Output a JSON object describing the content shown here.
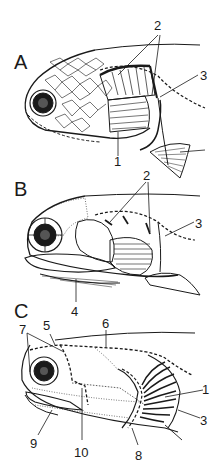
{
  "figure": {
    "panels": [
      {
        "id": "A",
        "label": "A",
        "callouts": [
          "1",
          "2",
          "3"
        ]
      },
      {
        "id": "B",
        "label": "B",
        "callouts": [
          "2",
          "3",
          "4"
        ]
      },
      {
        "id": "C",
        "label": "C",
        "callouts": [
          "1",
          "3",
          "5",
          "6",
          "7",
          "8",
          "9",
          "10"
        ]
      }
    ],
    "labels": {
      "A": "A",
      "B": "B",
      "C": "C",
      "a1": "1",
      "a2": "2",
      "a3": "3",
      "b2": "2",
      "b3": "3",
      "b4": "4",
      "c1": "1",
      "c3": "3",
      "c5": "5",
      "c6": "6",
      "c7": "7",
      "c8": "8",
      "c9": "9",
      "c10": "10"
    },
    "colors": {
      "ink": "#1a1a1a",
      "background": "#ffffff"
    }
  }
}
